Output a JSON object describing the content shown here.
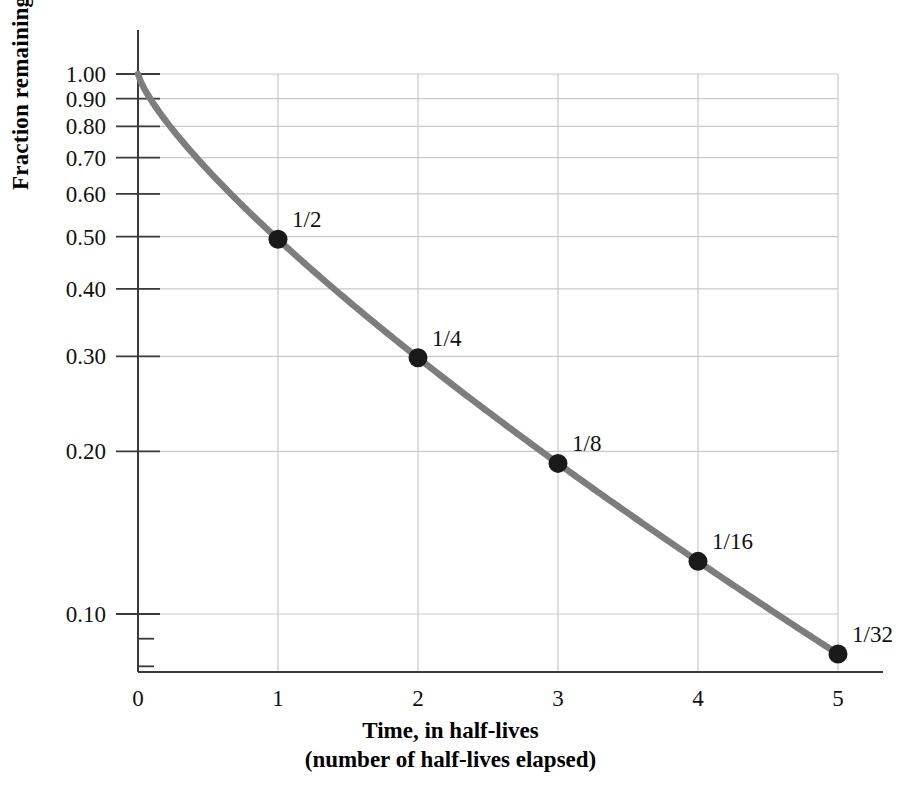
{
  "chart_data": {
    "type": "line",
    "title": "",
    "xlabel": "Time, in half-lives",
    "xlabel_sub": "(number of half-lives elapsed)",
    "ylabel": "Fraction remaining",
    "x": [
      0,
      1,
      2,
      3,
      4,
      5
    ],
    "values": [
      1,
      0.5,
      0.25,
      0.125,
      0.0625,
      0.03125
    ],
    "series": [
      {
        "name": "Fraction remaining",
        "values": [
          1,
          0.5,
          0.25,
          0.125,
          0.0625,
          0.03125
        ]
      }
    ],
    "markers": [
      {
        "x": 1,
        "y": 0.5,
        "label": "1/2"
      },
      {
        "x": 2,
        "y": 0.25,
        "label": "1/4"
      },
      {
        "x": 3,
        "y": 0.125,
        "label": "1/8"
      },
      {
        "x": 4,
        "y": 0.0625,
        "label": "1/16"
      },
      {
        "x": 5,
        "y": 0.03125,
        "label": "1/32"
      }
    ],
    "xticks": [
      "0",
      "1",
      "2",
      "3",
      "4",
      "5"
    ],
    "yticks": [
      "0.10",
      "0.20",
      "0.30",
      "0.40",
      "0.50",
      "0.60",
      "0.70",
      "0.80",
      "0.90",
      "1.00"
    ],
    "ytick_values": [
      0.1,
      0.2,
      0.3,
      0.4,
      0.5,
      0.6,
      0.7,
      0.8,
      0.9,
      1.0
    ],
    "yscale": "log",
    "xscale": "linear",
    "xlim": [
      0,
      5
    ],
    "ylim": [
      0.078,
      1.0
    ],
    "grid": true,
    "legend": "none",
    "curve_color": "#7d7d7d",
    "marker_color": "#1a1a1a",
    "grid_color": "#c9c9c9",
    "axis_color": "#555555"
  },
  "figure": {
    "background": "#ffffff"
  }
}
